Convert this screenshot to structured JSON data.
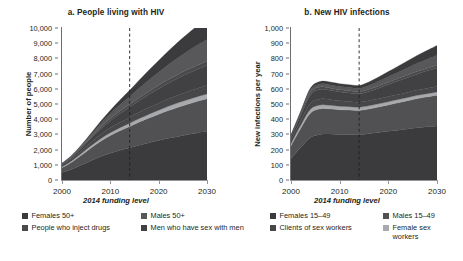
{
  "figure": {
    "xlabel": "2014 funding level"
  },
  "panels": [
    {
      "title": "a. People living with HIV",
      "ylabel": "Number of people",
      "yticks": [
        "0",
        "1,000",
        "2,000",
        "3,000",
        "4,000",
        "5,000",
        "6,000",
        "7,000",
        "8,000",
        "9,000",
        "10,000"
      ],
      "xticks": [
        "2000",
        "2010",
        "2020",
        "2030"
      ]
    },
    {
      "title": "b. New HIV infections",
      "ylabel": "New infections per year",
      "yticks": [
        "0",
        "100",
        "200",
        "300",
        "400",
        "500",
        "600",
        "700",
        "800",
        "900",
        "1,000"
      ],
      "xticks": [
        "2000",
        "2010",
        "2020",
        "2030"
      ]
    }
  ],
  "legend": {
    "items": [
      {
        "label": "Females 50+",
        "color": "#3b3b3d"
      },
      {
        "label": "Males 50+",
        "color": "#58585b"
      },
      {
        "label": "People who inject drugs",
        "color": "#4a4a4d"
      },
      {
        "label": "Men who have sex with men",
        "color": "#414143"
      },
      {
        "label": "Females 15–49",
        "color": "#3b3b3d"
      },
      {
        "label": "Males 15–49",
        "color": "#515153"
      },
      {
        "label": "Clients of sex workers",
        "color": "#474749"
      },
      {
        "label": "Female sex workers",
        "color": "#a7a9ac"
      }
    ]
  },
  "chart_data": [
    {
      "type": "area",
      "title": "a. People living with HIV",
      "xlabel": "2014 funding level",
      "ylabel": "Number of people",
      "xlim": [
        2000,
        2030
      ],
      "ylim": [
        0,
        10000
      ],
      "ytick_step": 1000,
      "grid": false,
      "legend_position": "below",
      "annotation": {
        "type": "vline",
        "x": 2014,
        "style": "dashed",
        "label": "2014 funding level"
      },
      "x": [
        2000,
        2002,
        2004,
        2006,
        2008,
        2010,
        2012,
        2014,
        2016,
        2018,
        2020,
        2022,
        2024,
        2026,
        2028,
        2030
      ],
      "series": [
        {
          "name": "Females 15–49",
          "color": "#3b3b3d",
          "values": [
            480,
            700,
            980,
            1270,
            1540,
            1760,
            1950,
            2120,
            2290,
            2450,
            2600,
            2740,
            2870,
            2990,
            3100,
            3200
          ]
        },
        {
          "name": "Males 15–49",
          "color": "#515153",
          "values": [
            330,
            470,
            650,
            840,
            1010,
            1160,
            1290,
            1400,
            1520,
            1630,
            1730,
            1830,
            1920,
            2000,
            2080,
            2150
          ]
        },
        {
          "name": "Female sex workers",
          "color": "#a7a9ac",
          "values": [
            60,
            85,
            115,
            145,
            170,
            190,
            205,
            220,
            235,
            250,
            262,
            275,
            286,
            296,
            305,
            312
          ]
        },
        {
          "name": "Clients of sex workers",
          "color": "#474749",
          "values": [
            95,
            135,
            185,
            235,
            280,
            320,
            352,
            380,
            408,
            434,
            458,
            480,
            500,
            518,
            534,
            548
          ]
        },
        {
          "name": "Men who have sex with men",
          "color": "#414143",
          "values": [
            55,
            95,
            160,
            250,
            360,
            470,
            575,
            670,
            770,
            865,
            955,
            1040,
            1120,
            1195,
            1265,
            1330
          ]
        },
        {
          "name": "People who inject drugs",
          "color": "#4a4a4d",
          "values": [
            40,
            60,
            85,
            110,
            135,
            155,
            172,
            188,
            203,
            217,
            230,
            242,
            253,
            263,
            272,
            280
          ]
        },
        {
          "name": "Males 50+",
          "color": "#58585b",
          "values": [
            25,
            45,
            80,
            135,
            210,
            300,
            400,
            505,
            620,
            740,
            860,
            980,
            1100,
            1215,
            1325,
            1430
          ]
        },
        {
          "name": "Females 50+",
          "color": "#3b3b3d",
          "values": [
            15,
            30,
            55,
            95,
            155,
            230,
            320,
            420,
            530,
            650,
            775,
            900,
            1025,
            1145,
            1260,
            1370
          ]
        }
      ],
      "total_2000": 1100,
      "total_2030": 9650
    },
    {
      "type": "area",
      "title": "b. New HIV infections",
      "xlabel": "2014 funding level",
      "ylabel": "New infections per year",
      "xlim": [
        2000,
        2030
      ],
      "ylim": [
        0,
        1000
      ],
      "ytick_step": 100,
      "grid": false,
      "legend_position": "below",
      "annotation": {
        "type": "vline",
        "x": 2014,
        "style": "dashed",
        "label": "2014 funding level"
      },
      "x": [
        2000,
        2002,
        2004,
        2006,
        2008,
        2010,
        2012,
        2014,
        2016,
        2018,
        2020,
        2022,
        2024,
        2026,
        2028,
        2030
      ],
      "series": [
        {
          "name": "Females 15–49",
          "color": "#3b3b3d",
          "values": [
            140,
            215,
            280,
            300,
            302,
            300,
            300,
            300,
            305,
            312,
            320,
            328,
            336,
            344,
            350,
            356
          ]
        },
        {
          "name": "Males 15–49",
          "color": "#515153",
          "values": [
            85,
            125,
            160,
            168,
            166,
            162,
            160,
            158,
            162,
            168,
            174,
            180,
            186,
            192,
            197,
            202
          ]
        },
        {
          "name": "Female sex workers",
          "color": "#a7a9ac",
          "values": [
            14,
            20,
            25,
            25,
            24,
            23,
            22,
            21,
            21,
            21,
            21,
            21,
            21,
            21,
            21,
            21
          ]
        },
        {
          "name": "Clients of sex workers",
          "color": "#474749",
          "values": [
            22,
            32,
            40,
            40,
            38,
            36,
            34,
            33,
            33,
            33,
            34,
            34,
            35,
            35,
            36,
            36
          ]
        },
        {
          "name": "Men who have sex with men",
          "color": "#414143",
          "values": [
            18,
            32,
            55,
            62,
            60,
            58,
            57,
            56,
            62,
            70,
            79,
            88,
            97,
            106,
            114,
            122
          ]
        },
        {
          "name": "People who inject drugs",
          "color": "#4a4a4d",
          "values": [
            9,
            13,
            17,
            17,
            16,
            15,
            14,
            14,
            14,
            15,
            15,
            16,
            16,
            17,
            17,
            18
          ]
        },
        {
          "name": "Males 50+",
          "color": "#58585b",
          "values": [
            5,
            9,
            16,
            20,
            21,
            21,
            21,
            21,
            25,
            30,
            36,
            42,
            48,
            54,
            60,
            66
          ]
        },
        {
          "name": "Females 50+",
          "color": "#3b3b3d",
          "values": [
            4,
            7,
            12,
            16,
            18,
            19,
            19,
            19,
            23,
            28,
            34,
            40,
            46,
            52,
            58,
            64
          ]
        }
      ],
      "peak_year": 2005,
      "peak_value": 630,
      "value_2014": 572,
      "value_2030": 860
    }
  ]
}
